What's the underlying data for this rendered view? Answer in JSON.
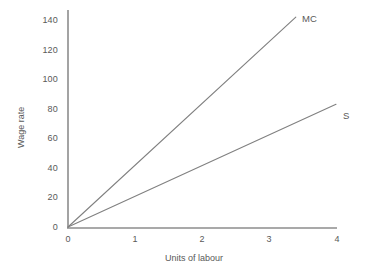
{
  "chart_data": {
    "type": "line",
    "title": "",
    "xlabel": "Units of labour",
    "ylabel": "Wage rate",
    "xlim": [
      0,
      4
    ],
    "ylim": [
      0,
      140
    ],
    "xticks": [
      "0",
      "1",
      "2",
      "3",
      "4"
    ],
    "yticks": [
      "0",
      "20",
      "40",
      "60",
      "80",
      "100",
      "120",
      "140"
    ],
    "grid": false,
    "legend_position": "inline-right-of-line-end",
    "series": [
      {
        "name": "MC",
        "label": "MC",
        "color": "#808080",
        "points": [
          [
            0,
            0
          ],
          [
            3.4,
            142
          ]
        ]
      },
      {
        "name": "S",
        "label": "S",
        "color": "#808080",
        "points": [
          [
            0,
            0
          ],
          [
            4,
            83
          ]
        ]
      }
    ]
  },
  "axes": {
    "y_axis_name": "y-axis-line",
    "x_axis_name": "x-axis-line",
    "color": "#8c8c8c"
  },
  "colors": {
    "background": "#ffffff",
    "line": "#808080",
    "text": "#595959",
    "axis": "#8c8c8c"
  }
}
